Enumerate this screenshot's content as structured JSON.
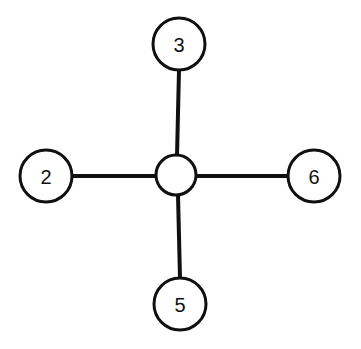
{
  "diagram": {
    "type": "star-graph",
    "title": "",
    "background_color": "#ffffff",
    "stroke_color": "#101010",
    "canvas": {
      "width": 361,
      "height": 349
    },
    "nodes": [
      {
        "id": "center",
        "label": "",
        "role": "hub",
        "cx": 176,
        "cy": 175,
        "r": 20,
        "has_label": false
      },
      {
        "id": "top",
        "label": "3",
        "role": "leaf",
        "cx": 179,
        "cy": 44,
        "r": 26,
        "has_label": true
      },
      {
        "id": "left",
        "label": "2",
        "role": "leaf",
        "cx": 46,
        "cy": 176,
        "r": 26,
        "has_label": true
      },
      {
        "id": "right",
        "label": "6",
        "role": "leaf",
        "cx": 314,
        "cy": 176,
        "r": 26,
        "has_label": true
      },
      {
        "id": "bottom",
        "label": "5",
        "role": "leaf",
        "cx": 180,
        "cy": 304,
        "r": 26,
        "has_label": true
      }
    ],
    "edges": [
      {
        "id": "edge-center-top",
        "from": "center",
        "to": "top",
        "x1": 177,
        "y1": 156,
        "x2": 179,
        "y2": 70
      },
      {
        "id": "edge-center-left",
        "from": "center",
        "to": "left",
        "x1": 157,
        "y1": 176,
        "x2": 72,
        "y2": 176
      },
      {
        "id": "edge-center-right",
        "from": "center",
        "to": "right",
        "x1": 196,
        "y1": 176,
        "x2": 288,
        "y2": 176
      },
      {
        "id": "edge-center-bottom",
        "from": "center",
        "to": "bottom",
        "x1": 178,
        "y1": 195,
        "x2": 180,
        "y2": 278
      }
    ]
  }
}
